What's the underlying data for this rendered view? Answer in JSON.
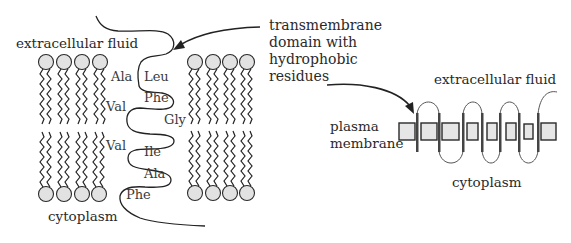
{
  "left_diagram": {
    "top_label": "extracellular fluid",
    "bottom_label": "cytoplasm",
    "residues": [
      {
        "name": "Ala",
        "x": 117,
        "y": 78
      },
      {
        "name": "Leu",
        "x": 144,
        "y": 78
      },
      {
        "name": "Val",
        "x": 106,
        "y": 109
      },
      {
        "name": "Phe",
        "x": 144,
        "y": 100
      },
      {
        "name": "Gly",
        "x": 164,
        "y": 121
      },
      {
        "name": "Val",
        "x": 106,
        "y": 148
      },
      {
        "name": "Ile",
        "x": 144,
        "y": 154
      },
      {
        "name": "Ala",
        "x": 144,
        "y": 176
      },
      {
        "name": "Phe",
        "x": 126,
        "y": 197
      }
    ]
  },
  "annotation": {
    "lines": [
      "transmembrane",
      "domain with",
      "hydrophobic",
      "residues"
    ]
  },
  "right_diagram": {
    "top_label": "extracellular fluid",
    "side_label_lines": [
      "plasma",
      "membrane"
    ],
    "bottom_label": "cytoplasm"
  },
  "colors": {
    "lipid_head_fill": "#e2e2e2",
    "stroke": "#222222",
    "membrane_box_fill": "#e6e6e6"
  }
}
